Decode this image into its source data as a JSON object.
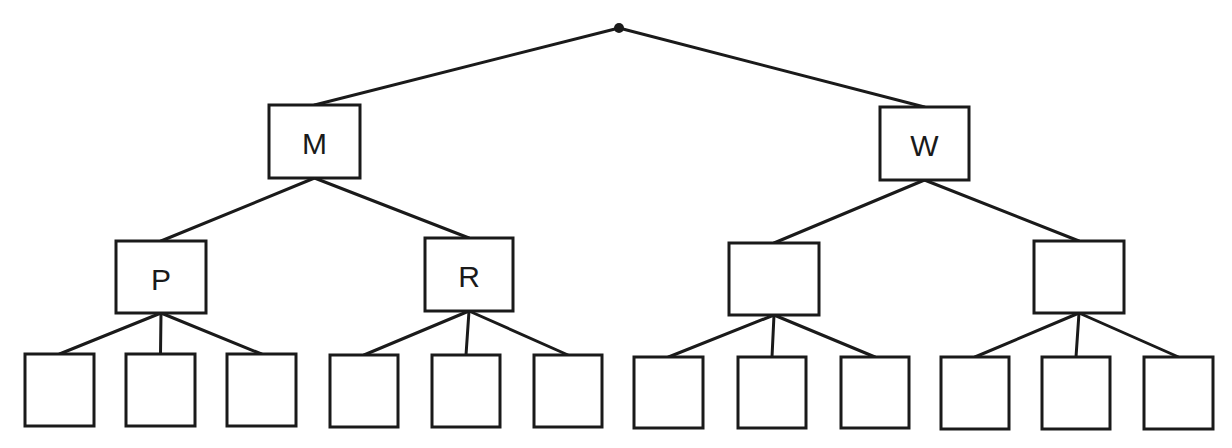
{
  "diagram": {
    "type": "tree",
    "colors": {
      "stroke": "#1a1a1a",
      "fill": "#ffffff",
      "text": "#1a1a1a"
    },
    "root": {
      "id": "root",
      "x": 619,
      "y": 28,
      "r": 5
    },
    "nodes": [
      {
        "id": "M",
        "label": "M",
        "x": 269,
        "y": 105,
        "w": 91,
        "h": 73,
        "level": 1
      },
      {
        "id": "W",
        "label": "W",
        "x": 880,
        "y": 107,
        "w": 89,
        "h": 73,
        "level": 1
      },
      {
        "id": "P",
        "label": "P",
        "x": 116,
        "y": 241,
        "w": 90,
        "h": 72,
        "level": 2
      },
      {
        "id": "R",
        "label": "R",
        "x": 425,
        "y": 238,
        "w": 88,
        "h": 73,
        "level": 2
      },
      {
        "id": "W1",
        "label": "",
        "x": 729,
        "y": 243,
        "w": 90,
        "h": 72,
        "level": 2
      },
      {
        "id": "W2",
        "label": "",
        "x": 1034,
        "y": 241,
        "w": 90,
        "h": 72,
        "level": 2
      },
      {
        "id": "P1",
        "label": "",
        "x": 25,
        "y": 354,
        "w": 69,
        "h": 72,
        "level": 3
      },
      {
        "id": "P2",
        "label": "",
        "x": 126,
        "y": 354,
        "w": 69,
        "h": 72,
        "level": 3
      },
      {
        "id": "P3",
        "label": "",
        "x": 227,
        "y": 354,
        "w": 69,
        "h": 72,
        "level": 3
      },
      {
        "id": "R1",
        "label": "",
        "x": 330,
        "y": 355,
        "w": 68,
        "h": 72,
        "level": 3
      },
      {
        "id": "R2",
        "label": "",
        "x": 432,
        "y": 355,
        "w": 68,
        "h": 72,
        "level": 3
      },
      {
        "id": "R3",
        "label": "",
        "x": 534,
        "y": 355,
        "w": 68,
        "h": 72,
        "level": 3
      },
      {
        "id": "A1",
        "label": "",
        "x": 634,
        "y": 357,
        "w": 69,
        "h": 71,
        "level": 3
      },
      {
        "id": "A2",
        "label": "",
        "x": 738,
        "y": 357,
        "w": 68,
        "h": 71,
        "level": 3
      },
      {
        "id": "A3",
        "label": "",
        "x": 841,
        "y": 357,
        "w": 68,
        "h": 71,
        "level": 3
      },
      {
        "id": "B1",
        "label": "",
        "x": 941,
        "y": 357,
        "w": 68,
        "h": 72,
        "level": 3
      },
      {
        "id": "B2",
        "label": "",
        "x": 1042,
        "y": 357,
        "w": 68,
        "h": 72,
        "level": 3
      },
      {
        "id": "B3",
        "label": "",
        "x": 1144,
        "y": 357,
        "w": 69,
        "h": 72,
        "level": 3
      }
    ],
    "edges": [
      {
        "from": "root",
        "to": "M"
      },
      {
        "from": "root",
        "to": "W"
      },
      {
        "from": "M",
        "to": "P"
      },
      {
        "from": "M",
        "to": "R"
      },
      {
        "from": "W",
        "to": "W1"
      },
      {
        "from": "W",
        "to": "W2"
      },
      {
        "from": "P",
        "to": "P1"
      },
      {
        "from": "P",
        "to": "P2"
      },
      {
        "from": "P",
        "to": "P3"
      },
      {
        "from": "R",
        "to": "R1"
      },
      {
        "from": "R",
        "to": "R2"
      },
      {
        "from": "R",
        "to": "R3"
      },
      {
        "from": "W1",
        "to": "A1"
      },
      {
        "from": "W1",
        "to": "A2"
      },
      {
        "from": "W1",
        "to": "A3"
      },
      {
        "from": "W2",
        "to": "B1"
      },
      {
        "from": "W2",
        "to": "B2"
      },
      {
        "from": "W2",
        "to": "B3"
      }
    ]
  }
}
